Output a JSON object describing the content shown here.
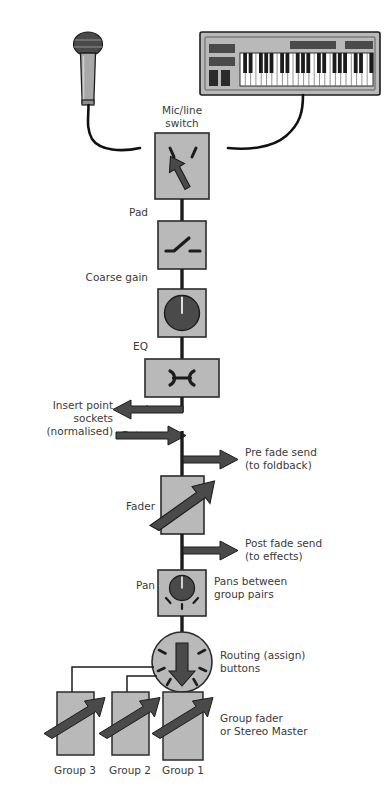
{
  "diagram": {
    "colors": {
      "panel_fill": "#b9b9b9",
      "panel_stroke": "#2b2b2b",
      "knob_fill": "#4a4a4a",
      "arrow_fill": "#4a4a4a",
      "signal_line": "#1c1c1c",
      "text": "#3a3a3a",
      "background": "#ffffff",
      "keyboard_body": "#b9b9b9",
      "keyboard_panel": "#4a4a4a",
      "key_white": "#ffffff",
      "key_black": "#1c1c1c",
      "mic_head": "#4a4a4a",
      "mic_body": "#a8a8a8"
    },
    "sources": {
      "microphone": "microphone-icon",
      "keyboard": "keyboard-icon"
    },
    "stages": [
      {
        "id": "mic-line-switch",
        "label": "Mic/line\nswitch",
        "label_line1": "Mic/line",
        "label_line2": "switch",
        "label_position": "above",
        "symbol": "switch-arrow"
      },
      {
        "id": "pad",
        "label": "Pad",
        "label_position": "left",
        "symbol": "switch-contact"
      },
      {
        "id": "coarse-gain",
        "label": "Coarse gain",
        "label_position": "left",
        "symbol": "rotary-knob"
      },
      {
        "id": "eq",
        "label": "EQ",
        "label_position": "left",
        "symbol": "eq-bowtie"
      },
      {
        "id": "fader",
        "label": "Fader",
        "label_position": "left",
        "symbol": "fader-arrow"
      },
      {
        "id": "pan",
        "label": "Pan",
        "label_position": "left",
        "symbol": "pan-knob"
      },
      {
        "id": "routing",
        "label": "Routing (assign)\nbuttons",
        "label_position": "right",
        "symbol": "routing-circle"
      }
    ],
    "insert_point": {
      "line1": "Insert point",
      "line2": "sockets",
      "line3": "(normalised)",
      "send_label": "Send",
      "return_label": "Return"
    },
    "sends": [
      {
        "id": "pre-fade-send",
        "line1": "Pre fade send",
        "line2": "(to foldback)"
      },
      {
        "id": "post-fade-send",
        "line1": "Post fade send",
        "line2": "(to effects)"
      }
    ],
    "pan_note": {
      "line1": "Pans between",
      "line2": "group pairs"
    },
    "routing_note": {
      "line1": "Routing (assign)",
      "line2": "buttons"
    },
    "group_note": {
      "line1": "Group fader",
      "line2": "or Stereo Master"
    },
    "groups": [
      {
        "id": "group-3",
        "label": "Group 3"
      },
      {
        "id": "group-2",
        "label": "Group 2"
      },
      {
        "id": "group-1",
        "label": "Group 1"
      }
    ]
  }
}
